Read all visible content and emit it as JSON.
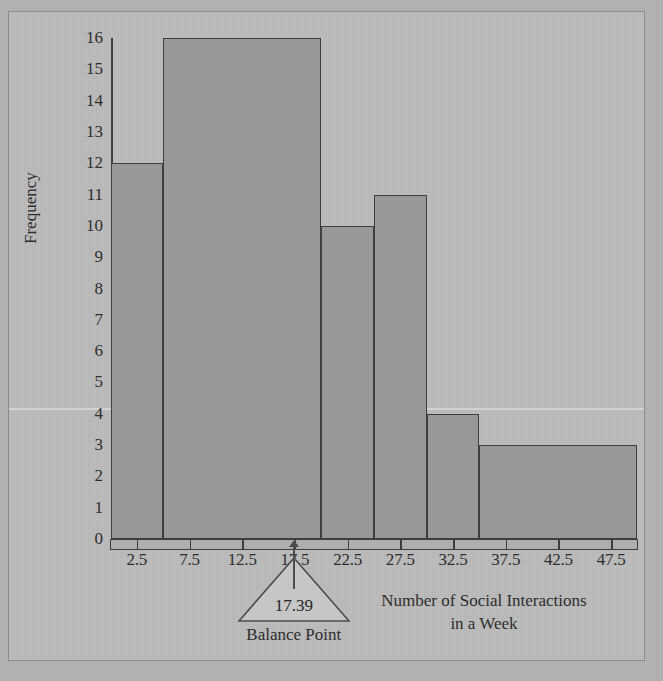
{
  "figure": {
    "y_axis_title": "Frequency",
    "x_axis_title_line1": "Number of Social Interactions",
    "x_axis_title_line2": "in a Week",
    "balance_value": "17.39",
    "balance_caption": "Balance Point",
    "bottom_artifact": "",
    "colors": {
      "page_background": "#b3b3b3",
      "plot_background": "#bcbcbc",
      "bar_fill": "#999999",
      "bar_outline": "#3c3c3c",
      "axis": "#3b3b3b",
      "text": "#2b2b2b",
      "triangle_fill": "#c9c9c9"
    }
  },
  "chart_data": {
    "type": "bar",
    "title": "",
    "subtitle": "",
    "xlabel": "Number of Social Interactions in a Week",
    "ylabel": "Frequency",
    "xlim": [
      0,
      50
    ],
    "ylim": [
      0,
      16
    ],
    "grid": false,
    "legend": null,
    "x_tick_labels": [
      "2.5",
      "7.5",
      "12.5",
      "17.5",
      "22.5",
      "27.5",
      "32.5",
      "37.5",
      "42.5",
      "47.5"
    ],
    "x_tick_values": [
      2.5,
      7.5,
      12.5,
      17.5,
      22.5,
      27.5,
      32.5,
      37.5,
      42.5,
      47.5
    ],
    "y_tick_labels": [
      "0",
      "1",
      "2",
      "3",
      "4",
      "5",
      "6",
      "7",
      "8",
      "9",
      "10",
      "11",
      "12",
      "13",
      "14",
      "15",
      "16"
    ],
    "y_tick_values": [
      0,
      1,
      2,
      3,
      4,
      5,
      6,
      7,
      8,
      9,
      10,
      11,
      12,
      13,
      14,
      15,
      16
    ],
    "bins": [
      {
        "label": "0-5",
        "x0": 0,
        "x1": 5,
        "frequency": 12
      },
      {
        "label": "5-20",
        "x0": 5,
        "x1": 20,
        "frequency": 16
      },
      {
        "label": "20-25",
        "x0": 20,
        "x1": 25,
        "frequency": 10
      },
      {
        "label": "25-30",
        "x0": 25,
        "x1": 30,
        "frequency": 11
      },
      {
        "label": "30-35",
        "x0": 30,
        "x1": 35,
        "frequency": 4
      },
      {
        "label": "35-50",
        "x0": 35,
        "x1": 50,
        "frequency": 3
      }
    ],
    "annotations": [
      {
        "name": "balance-point",
        "x": 17.39,
        "label": "17.39",
        "caption": "Balance Point"
      }
    ]
  }
}
